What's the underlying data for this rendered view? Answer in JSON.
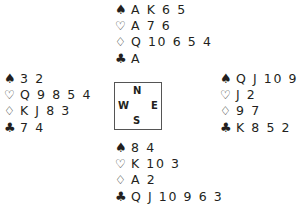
{
  "suits": {
    "spades": "♠",
    "hearts": "♡",
    "diamonds": "♢",
    "clubs": "♣"
  },
  "compass": {
    "north": "N",
    "west": "W",
    "east": "E",
    "south": "S"
  },
  "hands": {
    "north": {
      "spades": "A K 6 5",
      "hearts": "A 7 6",
      "diamonds": "Q 10 6 5 4",
      "clubs": "A"
    },
    "west": {
      "spades": "3 2",
      "hearts": "Q 9 8 5 4",
      "diamonds": "K J 8 3",
      "clubs": "7 4"
    },
    "east": {
      "spades": "Q J 10 9 7",
      "hearts": "J 2",
      "diamonds": "9 7",
      "clubs": "K 8 5 2"
    },
    "south": {
      "spades": "8 4",
      "hearts": "K 10 3",
      "diamonds": "A 2",
      "clubs": "Q J 10 9 6 3"
    }
  }
}
